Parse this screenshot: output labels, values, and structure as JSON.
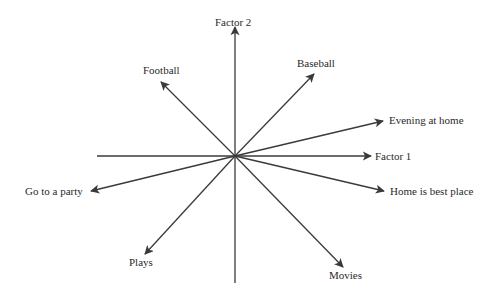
{
  "diagram": {
    "type": "factor-loading-vector-plot",
    "stroke_color": "#3a3a3a",
    "text_color": "#2a2a2a",
    "origin": {
      "x": 235,
      "y": 156
    },
    "axes": {
      "factor1": {
        "label": "Factor 1",
        "from": {
          "x": 97,
          "y": 156
        },
        "to": {
          "x": 371,
          "y": 156
        }
      },
      "factor2": {
        "label": "Factor 2",
        "from": {
          "x": 235,
          "y": 283
        },
        "to": {
          "x": 235,
          "y": 27
        }
      }
    },
    "vectors": [
      {
        "label": "Football",
        "tip": {
          "x": 161,
          "y": 82
        }
      },
      {
        "label": "Baseball",
        "tip": {
          "x": 314,
          "y": 74
        }
      },
      {
        "label": "Evening at home",
        "tip": {
          "x": 383,
          "y": 121
        }
      },
      {
        "label": "Home is best place",
        "tip": {
          "x": 384,
          "y": 191
        }
      },
      {
        "label": "Movies",
        "tip": {
          "x": 343,
          "y": 267
        }
      },
      {
        "label": "Plays",
        "tip": {
          "x": 145,
          "y": 254
        }
      },
      {
        "label": "Go to a party",
        "tip": {
          "x": 91,
          "y": 191
        }
      }
    ]
  }
}
